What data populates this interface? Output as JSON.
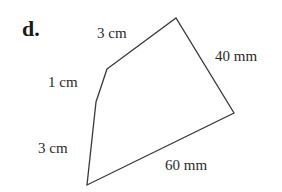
{
  "part_label": "d.",
  "shape": {
    "type": "pentagon",
    "stroke_color": "#3a3a3a",
    "fill_color": "#ffffff",
    "vertices": [
      {
        "x": 107,
        "y": 69
      },
      {
        "x": 176,
        "y": 18
      },
      {
        "x": 234,
        "y": 113
      },
      {
        "x": 87,
        "y": 185
      },
      {
        "x": 96,
        "y": 102
      }
    ]
  },
  "side_labels": {
    "top": "3 cm",
    "right": "40 mm",
    "bottom": "60 mm",
    "left_lower": "3 cm",
    "left_upper": "1 cm"
  }
}
